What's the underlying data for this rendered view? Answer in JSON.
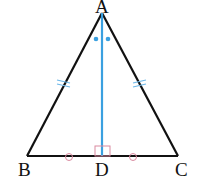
{
  "diagram": {
    "points": {
      "A": {
        "label": "A",
        "x": 102,
        "y": 13
      },
      "B": {
        "label": "B",
        "x": 27,
        "y": 156
      },
      "C": {
        "label": "C",
        "x": 178,
        "y": 156
      },
      "D": {
        "label": "D",
        "x": 102,
        "y": 156
      }
    },
    "segments": [
      {
        "from": "A",
        "to": "B",
        "color": "#111111"
      },
      {
        "from": "A",
        "to": "C",
        "color": "#111111"
      },
      {
        "from": "B",
        "to": "C",
        "color": "#111111"
      },
      {
        "from": "A",
        "to": "D",
        "color": "#3aa0e0"
      }
    ],
    "markers": {
      "equal_sides": [
        "AB",
        "AC"
      ],
      "equal_segments": [
        "BD",
        "DC"
      ],
      "equal_angles": [
        "BAD",
        "CAD"
      ],
      "right_angle_at": "D"
    },
    "colors": {
      "lines": "#111111",
      "altitude": "#3aa0e0",
      "marks": "#d98aa0",
      "tick_marks": "#6fb8e8"
    }
  }
}
